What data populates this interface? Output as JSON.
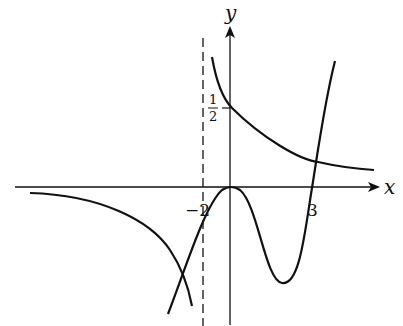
{
  "diagram": {
    "type": "function-graph",
    "axes": {
      "x_label": "x",
      "y_label": "y"
    },
    "tick_labels": {
      "neg_two": "−2",
      "three": "3",
      "half_num": "1",
      "half_den": "2"
    },
    "asymptote": {
      "x": -2,
      "style": "dashed"
    },
    "curves": [
      {
        "name": "hyperbola-right-branch",
        "desc": "decreasing, passes (0, 1/2), approaches x-axis"
      },
      {
        "name": "hyperbola-left-branch",
        "desc": "below x-axis, decreasing toward asymptote x=-2"
      },
      {
        "name": "cubic-like-curve",
        "desc": "local max at origin, local min between 0 and 3, crosses x-axis at 3"
      }
    ],
    "stroke_color": "#111111"
  }
}
